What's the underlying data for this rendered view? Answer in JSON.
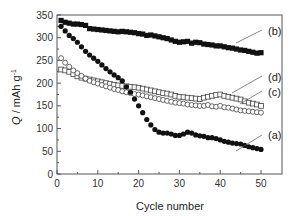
{
  "chart_data": {
    "type": "scatter",
    "title": "",
    "xlabel": "Cycle number",
    "ylabel": "Q / mAh g-1",
    "ylabel_parts": {
      "q": "Q",
      "unit": " / mAh g",
      "sup": "-1"
    },
    "xlim": [
      0,
      50
    ],
    "ylim": [
      0,
      350
    ],
    "xticks": [
      0,
      10,
      20,
      30,
      40,
      50
    ],
    "yticks": [
      0,
      50,
      100,
      150,
      200,
      250,
      300,
      350
    ],
    "grid": false,
    "legend": "inline annotations",
    "series": [
      {
        "name": "(a)",
        "marker": "filled-circle",
        "x": [
          1,
          2,
          3,
          4,
          5,
          6,
          7,
          8,
          9,
          10,
          11,
          12,
          13,
          14,
          15,
          16,
          17,
          18,
          19,
          20,
          21,
          22,
          23,
          24,
          25,
          26,
          27,
          28,
          29,
          30,
          31,
          32,
          33,
          34,
          35,
          36,
          37,
          38,
          39,
          40,
          41,
          42,
          43,
          44,
          45,
          46,
          47,
          48,
          49,
          50
        ],
        "values": [
          325,
          315,
          305,
          298,
          290,
          280,
          270,
          262,
          255,
          248,
          240,
          232,
          225,
          218,
          212,
          205,
          192,
          180,
          165,
          150,
          135,
          120,
          108,
          98,
          92,
          90,
          90,
          88,
          85,
          85,
          88,
          92,
          90,
          86,
          84,
          83,
          80,
          80,
          78,
          75,
          72,
          70,
          68,
          67,
          66,
          63,
          60,
          58,
          56,
          54
        ]
      },
      {
        "name": "(b)",
        "marker": "filled-square",
        "x": [
          1,
          2,
          3,
          4,
          5,
          6,
          7,
          8,
          9,
          10,
          11,
          12,
          13,
          14,
          15,
          16,
          17,
          18,
          19,
          20,
          21,
          22,
          23,
          24,
          25,
          26,
          27,
          28,
          29,
          30,
          31,
          32,
          33,
          34,
          35,
          36,
          37,
          38,
          39,
          40,
          41,
          42,
          43,
          44,
          45,
          46,
          47,
          48,
          49,
          50
        ],
        "values": [
          338,
          334,
          332,
          330,
          330,
          329,
          327,
          320,
          319,
          318,
          317,
          316,
          315,
          314,
          313,
          314,
          313,
          312,
          311,
          309,
          308,
          305,
          306,
          304,
          302,
          300,
          298,
          295,
          292,
          290,
          291,
          292,
          288,
          290,
          289,
          286,
          285,
          284,
          282,
          282,
          280,
          278,
          277,
          275,
          273,
          272,
          270,
          268,
          266,
          267
        ]
      },
      {
        "name": "(c)",
        "marker": "open-circle",
        "x": [
          1,
          2,
          3,
          4,
          5,
          6,
          7,
          8,
          9,
          10,
          11,
          12,
          13,
          14,
          15,
          16,
          17,
          18,
          19,
          20,
          21,
          22,
          23,
          24,
          25,
          26,
          27,
          28,
          29,
          30,
          31,
          32,
          33,
          34,
          35,
          36,
          37,
          38,
          39,
          40,
          41,
          42,
          43,
          44,
          45,
          46,
          47,
          48,
          49,
          50
        ],
        "values": [
          255,
          245,
          236,
          228,
          222,
          216,
          210,
          205,
          202,
          199,
          196,
          193,
          190,
          187,
          185,
          182,
          180,
          178,
          176,
          175,
          173,
          171,
          169,
          167,
          165,
          163,
          161,
          159,
          157,
          156,
          155,
          153,
          152,
          151,
          150,
          150,
          152,
          149,
          148,
          150,
          147,
          146,
          144,
          142,
          140,
          139,
          138,
          137,
          136,
          135
        ]
      },
      {
        "name": "(d)",
        "marker": "open-square",
        "x": [
          1,
          2,
          3,
          4,
          5,
          6,
          7,
          8,
          9,
          10,
          11,
          12,
          13,
          14,
          15,
          16,
          17,
          18,
          19,
          20,
          21,
          22,
          23,
          24,
          25,
          26,
          27,
          28,
          29,
          30,
          31,
          32,
          33,
          34,
          35,
          36,
          37,
          38,
          39,
          40,
          41,
          42,
          43,
          44,
          45,
          46,
          47,
          48,
          49,
          50
        ],
        "values": [
          230,
          228,
          225,
          220,
          215,
          212,
          210,
          208,
          206,
          204,
          202,
          200,
          198,
          196,
          195,
          194,
          193,
          192,
          191,
          190,
          188,
          186,
          184,
          182,
          180,
          178,
          177,
          175,
          172,
          170,
          169,
          168,
          167,
          166,
          165,
          168,
          170,
          172,
          174,
          175,
          172,
          170,
          168,
          166,
          164,
          160,
          157,
          155,
          153,
          150
        ]
      }
    ],
    "annotations": [
      {
        "text": "(b)",
        "label_x": 268,
        "label_y": 31,
        "line": [
          [
            236,
            43
          ],
          [
            262,
            30
          ]
        ]
      },
      {
        "text": "(d)",
        "label_x": 268,
        "label_y": 77,
        "line": [
          [
            232,
            93
          ],
          [
            262,
            76
          ]
        ]
      },
      {
        "text": "(c)",
        "label_x": 268,
        "label_y": 92,
        "line": [
          [
            240,
            104
          ],
          [
            262,
            91
          ]
        ]
      },
      {
        "text": "(a)",
        "label_x": 268,
        "label_y": 135,
        "line": [
          [
            236,
            151
          ],
          [
            262,
            135
          ]
        ]
      }
    ]
  }
}
